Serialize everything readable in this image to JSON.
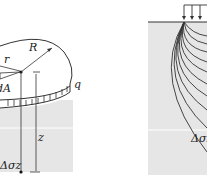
{
  "left_figure": {
    "labels": {
      "radius_R": "R",
      "radius_r": "r",
      "area": "dA",
      "load": "q",
      "depth": "z",
      "stress": "Δσz"
    }
  },
  "right_figure": {
    "labels": {
      "stress": "Δσz"
    }
  },
  "colors": {
    "soil": "#e6e6e6",
    "line": "#333333",
    "background": "#ffffff"
  }
}
